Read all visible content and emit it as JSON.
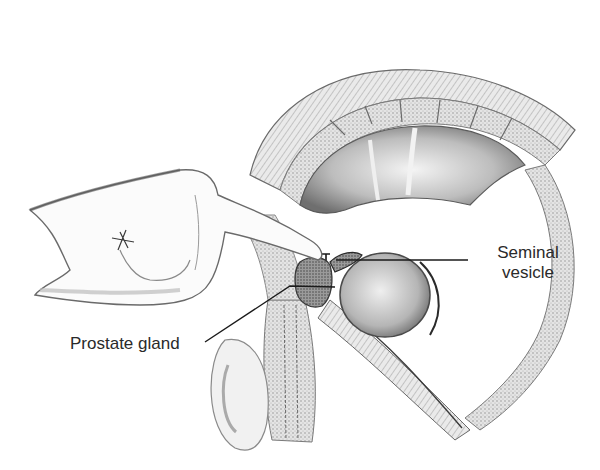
{
  "figure": {
    "labels": {
      "seminal_vesicle": {
        "line1": "Seminal",
        "line2": "vesicle"
      },
      "prostate_gland": "Prostate gland"
    },
    "colors": {
      "background": "#ffffff",
      "label_text": "#2a2a2a",
      "leader_line": "#1a1a1a",
      "shading_dark": "#5a5a5a",
      "shading_mid": "#9a9a9a",
      "shading_light": "#d0d0d0"
    }
  }
}
